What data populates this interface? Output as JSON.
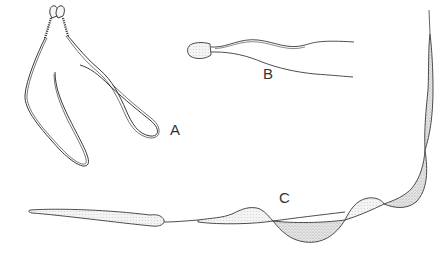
{
  "figure": {
    "type": "scientific line illustration",
    "panels": [
      {
        "id": "A",
        "label": "A",
        "description": "paired heads with two long looped flagella"
      },
      {
        "id": "B",
        "label": "B",
        "description": "rounded head with two flagella"
      },
      {
        "id": "C",
        "label": "C",
        "description": "elongated body with undulating stippled membrane"
      }
    ]
  },
  "colors": {
    "background": "#ffffff",
    "line": "#3a3a3a",
    "stipple": "#9a9a9a",
    "label": "#333333"
  }
}
